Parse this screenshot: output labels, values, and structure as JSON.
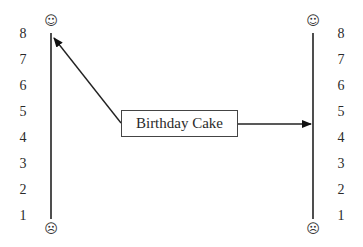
{
  "diagram": {
    "box_label": "Birthday Cake",
    "left_scale": {
      "ticks": [
        "8",
        "7",
        "6",
        "5",
        "4",
        "3",
        "2",
        "1"
      ],
      "top_icon": "☺",
      "bottom_icon": "☹",
      "top_icon_name": "smiley-face-icon",
      "bottom_icon_name": "frowning-face-icon"
    },
    "right_scale": {
      "ticks": [
        "8",
        "7",
        "6",
        "5",
        "4",
        "3",
        "2",
        "1"
      ],
      "top_icon": "☺",
      "bottom_icon": "☹",
      "top_icon_name": "smiley-face-icon",
      "bottom_icon_name": "frowning-face-icon"
    },
    "arrows": [
      {
        "from": "Birthday Cake",
        "to": "left scale",
        "points_to_value": 8
      },
      {
        "from": "Birthday Cake",
        "to": "right scale",
        "points_to_value": 4.5
      }
    ],
    "colors": {
      "line": "#222222",
      "text": "#2a2a2a",
      "background": "#ffffff"
    }
  }
}
